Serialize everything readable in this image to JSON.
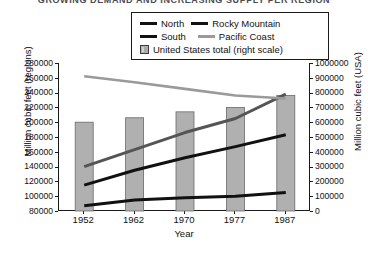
{
  "title": "GROWING DEMAND AND INCREASING SUPPLY PER REGION",
  "legend": {
    "entries": [
      {
        "label": "North",
        "style": "line",
        "color": "#111111"
      },
      {
        "label": "Rocky Mountain",
        "style": "line",
        "color": "#111111"
      },
      {
        "label": "South",
        "style": "line",
        "color": "#111111"
      },
      {
        "label": "Pacific Coast",
        "style": "line",
        "color": "#9a9a9a"
      },
      {
        "label": "United States total (right scale)",
        "style": "box",
        "color": "#b0b0b0"
      }
    ]
  },
  "axes": {
    "x_title": "Year",
    "y_left_title": "Million cubic feet (regions)",
    "y_right_title": "Million cubic feet (USA)",
    "x_ticks": [
      "1952",
      "1962",
      "1970",
      "1977",
      "1987"
    ],
    "y_left_ticks": [
      "280000",
      "260000",
      "240000",
      "220000",
      "200000",
      "180000",
      "160000",
      "140000",
      "120000",
      "100000",
      "80000"
    ],
    "y_right_ticks": [
      "1000000",
      "900000",
      "800000",
      "700000",
      "600000",
      "500000",
      "400000",
      "300000",
      "200000",
      "100000",
      "0"
    ]
  },
  "chart_data": {
    "type": "bar",
    "title": "GROWING DEMAND AND INCREASING SUPPLY PER REGION",
    "xlabel": "Year",
    "ylabel": "Million cubic feet (regions)",
    "y2label": "Million cubic feet (USA)",
    "categories": [
      "1952",
      "1962",
      "1970",
      "1977",
      "1987"
    ],
    "ylim": [
      80000,
      280000
    ],
    "y2lim": [
      0,
      1000000
    ],
    "grid": false,
    "legend_position": "top-center",
    "bars": {
      "name": "United States total (right scale)",
      "axis": "right",
      "color": "#b0b0b0",
      "values": [
        600000,
        630000,
        670000,
        700000,
        780000
      ]
    },
    "series": [
      {
        "name": "North",
        "axis": "left",
        "color": "#111111",
        "values": [
          87000,
          95000,
          98000,
          100000,
          105000
        ]
      },
      {
        "name": "South",
        "axis": "left",
        "color": "#111111",
        "values": [
          115000,
          135000,
          152000,
          167000,
          183000
        ]
      },
      {
        "name": "Rocky Mountain",
        "axis": "left",
        "color": "#555555",
        "values": [
          140000,
          163000,
          186000,
          205000,
          238000
        ]
      },
      {
        "name": "Pacific Coast",
        "axis": "left",
        "color": "#9a9a9a",
        "values": [
          262000,
          254000,
          245000,
          236000,
          232000
        ]
      }
    ]
  }
}
